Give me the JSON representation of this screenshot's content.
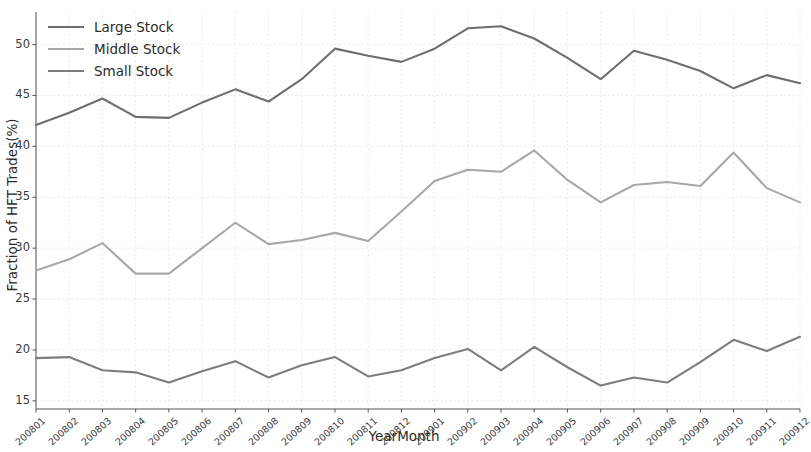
{
  "chart_data": {
    "type": "line",
    "title": "",
    "xlabel": "YearMonth",
    "ylabel": "Fraction of HFT Trades(%)",
    "categories": [
      "200801",
      "200802",
      "200803",
      "200804",
      "200805",
      "200806",
      "200807",
      "200808",
      "200809",
      "200810",
      "200811",
      "200812",
      "200901",
      "200902",
      "200903",
      "200904",
      "200905",
      "200906",
      "200907",
      "200908",
      "200909",
      "200910",
      "200911",
      "200912"
    ],
    "xlim": [
      0,
      23
    ],
    "ylim": [
      14.2,
      53.2
    ],
    "yticks": [
      15,
      20,
      25,
      30,
      35,
      40,
      45,
      50
    ],
    "grid": true,
    "legend_position": "upper left",
    "series": [
      {
        "name": "Large Stock",
        "color": "#6e6e6e",
        "values": [
          42.1,
          43.3,
          44.7,
          42.9,
          42.8,
          44.3,
          45.6,
          44.4,
          46.6,
          49.6,
          48.9,
          48.3,
          49.6,
          51.6,
          51.8,
          50.6,
          48.7,
          46.6,
          49.4,
          48.5,
          47.4,
          45.7,
          47.0,
          46.2
        ]
      },
      {
        "name": "Middle Stock",
        "color": "#a8a8a8",
        "values": [
          27.8,
          28.9,
          30.5,
          27.5,
          27.5,
          30.0,
          32.5,
          30.4,
          30.8,
          31.5,
          30.7,
          33.6,
          36.6,
          37.7,
          37.5,
          39.6,
          36.7,
          34.5,
          36.2,
          36.5,
          36.1,
          39.4,
          35.9,
          34.5
        ]
      },
      {
        "name": "Small Stock",
        "color": "#7d7d7d",
        "values": [
          19.2,
          19.3,
          18.0,
          17.8,
          16.8,
          17.9,
          18.9,
          17.3,
          18.5,
          19.3,
          17.4,
          18.0,
          19.2,
          20.1,
          18.0,
          20.3,
          18.3,
          16.5,
          17.3,
          16.8,
          18.8,
          21.0,
          19.9,
          21.3
        ]
      }
    ]
  },
  "legend": {
    "items": [
      {
        "label": "Large Stock"
      },
      {
        "label": "Middle Stock"
      },
      {
        "label": "Small Stock"
      }
    ]
  },
  "axes": {
    "y_label": "Fraction of HFT Trades(%)",
    "x_label": "YearMonth",
    "y_ticks": [
      "15",
      "20",
      "25",
      "30",
      "35",
      "40",
      "45",
      "50"
    ],
    "x_ticks": [
      "200801",
      "200802",
      "200803",
      "200804",
      "200805",
      "200806",
      "200807",
      "200808",
      "200809",
      "200810",
      "200811",
      "200812",
      "200901",
      "200902",
      "200903",
      "200904",
      "200905",
      "200906",
      "200907",
      "200908",
      "200909",
      "200910",
      "200911",
      "200912"
    ]
  },
  "colors": {
    "background": "#ffffff",
    "grid": "#e6e6e6",
    "axis": "#555555",
    "text": "#2b2b2b"
  }
}
